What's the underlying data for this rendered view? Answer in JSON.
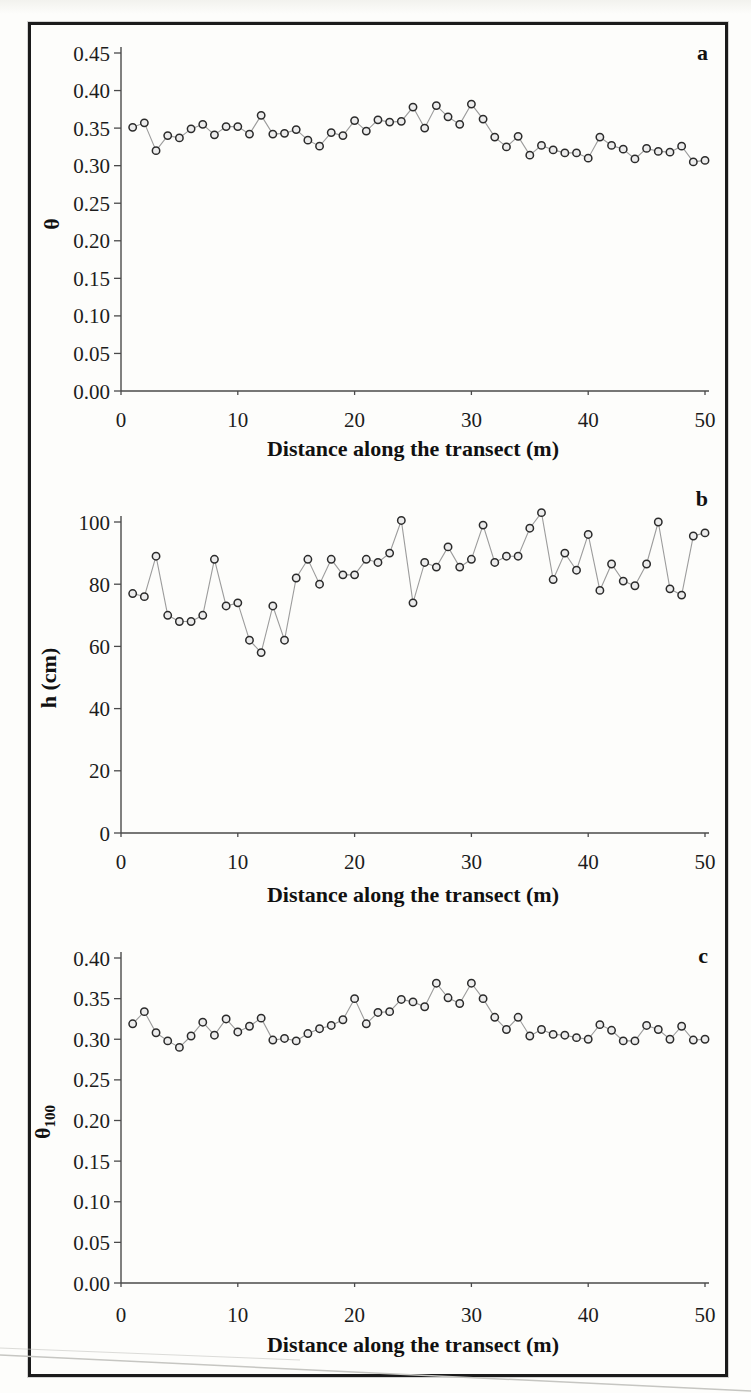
{
  "figure": {
    "colors": {
      "frame": "#1b1b1b",
      "axis": "#4a4a4a",
      "series_line": "#9c9c9c",
      "marker_stroke": "#2b2b2b",
      "marker_fill": "#ececec",
      "text": "#1c1c1c",
      "scan_artifact": "#c6c6c2"
    }
  },
  "chart_data": [
    {
      "panel_letter": "a",
      "type": "line",
      "title": "",
      "xlabel": "Distance along the transect (m)",
      "ylabel": "θ",
      "ylabel_sub": "",
      "xlim": [
        0,
        50
      ],
      "ylim": [
        0,
        0.45
      ],
      "xticks": [
        "0",
        "10",
        "20",
        "30",
        "40",
        "50"
      ],
      "yticks": [
        "0.45",
        "0.40",
        "0.35",
        "0.30",
        "0.25",
        "0.20",
        "0.15",
        "0.10",
        "0.05",
        "0.00"
      ],
      "grid": false,
      "legend": "none",
      "x_start": 1,
      "x_step": 1,
      "values": [
        0.351,
        0.357,
        0.32,
        0.34,
        0.337,
        0.349,
        0.355,
        0.341,
        0.352,
        0.352,
        0.342,
        0.367,
        0.342,
        0.343,
        0.348,
        0.334,
        0.326,
        0.344,
        0.34,
        0.36,
        0.346,
        0.361,
        0.358,
        0.359,
        0.378,
        0.35,
        0.38,
        0.365,
        0.355,
        0.382,
        0.362,
        0.338,
        0.325,
        0.339,
        0.314,
        0.327,
        0.321,
        0.317,
        0.317,
        0.31,
        0.338,
        0.327,
        0.322,
        0.309,
        0.323,
        0.319,
        0.318,
        0.326,
        0.305,
        0.307
      ]
    },
    {
      "panel_letter": "b",
      "type": "line",
      "title": "",
      "xlabel": "Distance along the transect (m)",
      "ylabel": "h (cm)",
      "ylabel_sub": "",
      "xlim": [
        0,
        50
      ],
      "ylim": [
        0,
        100
      ],
      "xticks": [
        "0",
        "10",
        "20",
        "30",
        "40",
        "50"
      ],
      "yticks": [
        "100",
        "80",
        "60",
        "40",
        "20",
        "0"
      ],
      "grid": false,
      "legend": "none",
      "x_start": 1,
      "x_step": 1,
      "values": [
        77,
        76,
        89,
        70,
        68,
        68,
        70,
        88,
        73,
        74,
        62,
        58,
        73,
        62,
        82,
        88,
        80,
        88,
        83,
        83,
        88,
        87,
        90,
        100.5,
        74,
        87,
        85.5,
        92,
        85.5,
        88,
        99,
        87,
        89,
        89,
        98,
        103,
        81.5,
        90,
        84.5,
        96,
        78,
        86.5,
        81,
        79.5,
        86.5,
        100,
        78.5,
        76.5,
        95.5,
        96.5
      ]
    },
    {
      "panel_letter": "c",
      "type": "line",
      "title": "",
      "xlabel": "Distance along the transect (m)",
      "ylabel": "θ",
      "ylabel_sub": "100",
      "xlim": [
        0,
        50
      ],
      "ylim": [
        0,
        0.4
      ],
      "xticks": [
        "0",
        "10",
        "20",
        "30",
        "40",
        "50"
      ],
      "yticks": [
        "0.40",
        "0.35",
        "0.30",
        "0.25",
        "0.20",
        "0.15",
        "0.10",
        "0.05",
        "0.00"
      ],
      "grid": false,
      "legend": "none",
      "x_start": 1,
      "x_step": 1,
      "values": [
        0.319,
        0.334,
        0.308,
        0.298,
        0.29,
        0.304,
        0.321,
        0.305,
        0.325,
        0.309,
        0.316,
        0.326,
        0.299,
        0.301,
        0.298,
        0.307,
        0.313,
        0.317,
        0.324,
        0.35,
        0.319,
        0.333,
        0.334,
        0.349,
        0.346,
        0.34,
        0.369,
        0.351,
        0.344,
        0.369,
        0.35,
        0.327,
        0.312,
        0.327,
        0.304,
        0.312,
        0.306,
        0.305,
        0.302,
        0.3,
        0.318,
        0.311,
        0.298,
        0.298,
        0.317,
        0.312,
        0.3,
        0.316,
        0.299,
        0.3
      ]
    }
  ]
}
